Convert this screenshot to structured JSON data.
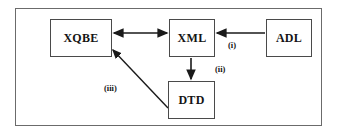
{
  "diagram": {
    "frame": {
      "name": "outer-frame"
    },
    "colors": {
      "background": "#ffffff",
      "frame_border": "#6b6b6b",
      "node_border": "#4a4a4a",
      "edge": "#1a1a1a",
      "text": "#141414"
    },
    "nodes": [
      {
        "id": "xqbe",
        "label": "XQBE",
        "x": 50,
        "y": 19,
        "w": 62,
        "h": 38
      },
      {
        "id": "xml",
        "label": "XML",
        "x": 169,
        "y": 19,
        "w": 46,
        "h": 38
      },
      {
        "id": "adl",
        "label": "ADL",
        "x": 266,
        "y": 19,
        "w": 46,
        "h": 38
      },
      {
        "id": "dtd",
        "label": "DTD",
        "x": 168,
        "y": 81,
        "w": 47,
        "h": 38
      }
    ],
    "edges": [
      {
        "id": "xqbe-xml",
        "from": "xqbe",
        "to": "xml",
        "arrows": "both",
        "label": ""
      },
      {
        "id": "adl-xml",
        "from": "adl",
        "to": "xml",
        "arrows": "to",
        "label": "(i)"
      },
      {
        "id": "xml-dtd",
        "from": "xml",
        "to": "dtd",
        "arrows": "to",
        "label": "(ii)"
      },
      {
        "id": "dtd-xqbe",
        "from": "dtd",
        "to": "xqbe",
        "arrows": "to",
        "label": "(iii)"
      }
    ],
    "edge_labels": [
      {
        "id": "label-i",
        "text": "(i)",
        "x": 228,
        "y": 41
      },
      {
        "id": "label-ii",
        "text": "(ii)",
        "x": 215,
        "y": 65
      },
      {
        "id": "label-iii",
        "text": "(iii)",
        "x": 104,
        "y": 84
      }
    ]
  }
}
